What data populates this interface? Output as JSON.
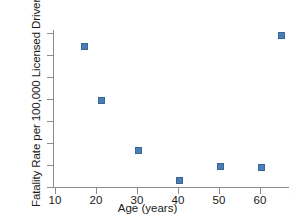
{
  "chart_data": {
    "type": "scatter",
    "title": "",
    "xlabel": "Age (years)",
    "ylabel": "Fatality Rate per 100,000 Licensed Drivers",
    "x": [
      17,
      21,
      30,
      40,
      50,
      60,
      65
    ],
    "values": [
      21.1,
      14.9,
      9.3,
      5.9,
      7.5,
      7.3,
      22.3
    ],
    "xlim": [
      7,
      72
    ],
    "ylim": [
      5.0,
      23.2
    ],
    "xticks": [
      10,
      20,
      30,
      40,
      50,
      60,
      70
    ],
    "xtick_labels": [
      "10",
      "20",
      "30",
      "40",
      "50",
      "60",
      "70"
    ],
    "yticks": [
      5.0,
      7.5,
      10.0,
      12.5,
      15.0,
      17.5,
      20.0,
      22.5
    ],
    "ytick_labels": [
      "5.0",
      "7.5",
      "10.0",
      "12.5",
      "15.0",
      "17.5",
      "20.0",
      "22.5"
    ],
    "grid": false,
    "legend": null,
    "marker_color": "#4a7eb5",
    "axis_color": "#8c8c8c",
    "background_color": "#ffffff"
  }
}
